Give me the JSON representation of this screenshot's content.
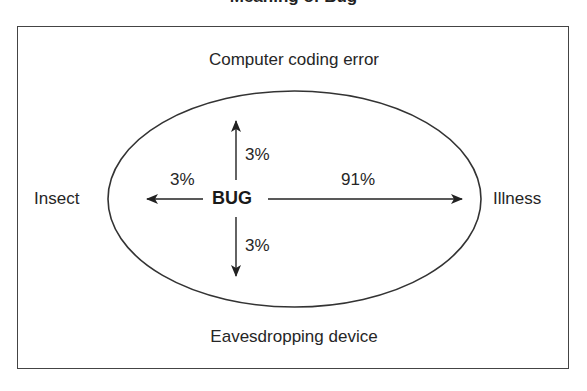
{
  "title": {
    "text": "Meaning of Bug",
    "cropped": true
  },
  "diagram": {
    "center_label": "BUG",
    "directions": {
      "up": {
        "target": "Computer coding error",
        "percent": "3%"
      },
      "left": {
        "target": "Insect",
        "percent": "3%"
      },
      "right": {
        "target": "Illness",
        "percent": "91%"
      },
      "down": {
        "target": "Eavesdropping device",
        "percent": "3%"
      }
    },
    "colors": {
      "line": "#333333",
      "text": "#262626",
      "background": "#ffffff"
    }
  }
}
